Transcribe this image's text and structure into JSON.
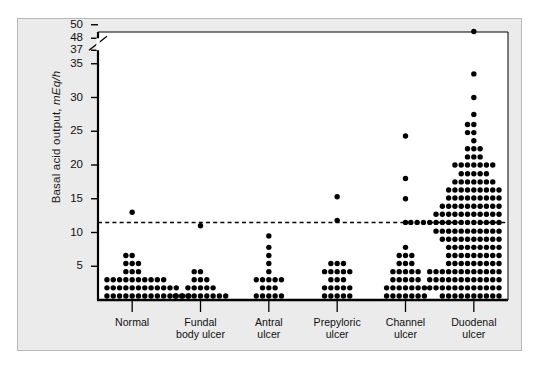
{
  "chart_data": {
    "type": "scatter",
    "plot_style": "dot-plot-strip-chart",
    "title": "",
    "xlabel": "",
    "ylabel": "Basal acid output, mEq/h",
    "ylabel_units_italic": "mEq/h",
    "ylim": [
      0,
      50
    ],
    "grid": false,
    "legend": null,
    "axis_break": {
      "present": true,
      "between": [
        37,
        48
      ],
      "marker": "diagonal-slash"
    },
    "yticks": [
      5,
      10,
      15,
      20,
      25,
      30,
      35,
      37,
      48,
      50
    ],
    "reference_line": {
      "value": 11.5,
      "style": "dashed",
      "orientation": "horizontal"
    },
    "categories": [
      "Normal",
      "Fundal body ulcer",
      "Antral ulcer",
      "Prepyloric ulcer",
      "Channel ulcer",
      "Duodenal ulcer"
    ],
    "category_lines": [
      [
        "Normal"
      ],
      [
        "Fundal",
        "body ulcer"
      ],
      [
        "Antral",
        "ulcer"
      ],
      [
        "Prepyloric",
        "ulcer"
      ],
      [
        "Channel",
        "ulcer"
      ],
      [
        "Duodenal",
        "ulcer"
      ]
    ],
    "series": [
      {
        "name": "Normal",
        "stacks": [
          {
            "value": 0.6,
            "count": 19
          },
          {
            "value": 1.8,
            "count": 15
          },
          {
            "value": 3.0,
            "count": 11
          },
          {
            "value": 4.2,
            "count": 3
          },
          {
            "value": 5.4,
            "count": 3
          },
          {
            "value": 6.6,
            "count": 2
          },
          {
            "value": 13.0,
            "count": 1
          }
        ]
      },
      {
        "name": "Fundal body ulcer",
        "stacks": [
          {
            "value": 0.6,
            "count": 9
          },
          {
            "value": 1.8,
            "count": 5
          },
          {
            "value": 3.0,
            "count": 3
          },
          {
            "value": 4.2,
            "count": 2
          },
          {
            "value": 11.0,
            "count": 1
          }
        ]
      },
      {
        "name": "Antral ulcer",
        "stacks": [
          {
            "value": 0.6,
            "count": 5
          },
          {
            "value": 1.8,
            "count": 3
          },
          {
            "value": 3.0,
            "count": 5
          },
          {
            "value": 4.2,
            "count": 1
          },
          {
            "value": 5.4,
            "count": 1
          },
          {
            "value": 6.6,
            "count": 1
          },
          {
            "value": 7.8,
            "count": 1
          },
          {
            "value": 9.5,
            "count": 1
          }
        ]
      },
      {
        "name": "Prepyloric ulcer",
        "stacks": [
          {
            "value": 0.6,
            "count": 5
          },
          {
            "value": 1.8,
            "count": 5
          },
          {
            "value": 3.0,
            "count": 3
          },
          {
            "value": 4.2,
            "count": 5
          },
          {
            "value": 5.4,
            "count": 3
          },
          {
            "value": 11.8,
            "count": 1
          },
          {
            "value": 15.3,
            "count": 1
          }
        ]
      },
      {
        "name": "Channel ulcer",
        "stacks": [
          {
            "value": 0.6,
            "count": 7
          },
          {
            "value": 1.8,
            "count": 7
          },
          {
            "value": 3.0,
            "count": 5
          },
          {
            "value": 4.2,
            "count": 5
          },
          {
            "value": 5.4,
            "count": 3
          },
          {
            "value": 6.6,
            "count": 3
          },
          {
            "value": 7.8,
            "count": 1
          },
          {
            "value": 11.5,
            "count": 1
          },
          {
            "value": 15.0,
            "count": 1
          },
          {
            "value": 18.0,
            "count": 1
          },
          {
            "value": 24.3,
            "count": 1
          }
        ]
      },
      {
        "name": "Duodenal ulcer",
        "stacks": [
          {
            "value": 0.6,
            "count": 11
          },
          {
            "value": 1.8,
            "count": 15
          },
          {
            "value": 3.0,
            "count": 15
          },
          {
            "value": 4.2,
            "count": 15
          },
          {
            "value": 5.4,
            "count": 9
          },
          {
            "value": 6.6,
            "count": 9
          },
          {
            "value": 7.8,
            "count": 9
          },
          {
            "value": 9.0,
            "count": 11
          },
          {
            "value": 10.2,
            "count": 13
          },
          {
            "value": 11.5,
            "count": 21
          },
          {
            "value": 12.7,
            "count": 13
          },
          {
            "value": 13.9,
            "count": 11
          },
          {
            "value": 15.1,
            "count": 9
          },
          {
            "value": 16.3,
            "count": 9
          },
          {
            "value": 17.5,
            "count": 7
          },
          {
            "value": 18.7,
            "count": 5
          },
          {
            "value": 20.0,
            "count": 7
          },
          {
            "value": 21.2,
            "count": 3
          },
          {
            "value": 22.4,
            "count": 3
          },
          {
            "value": 23.6,
            "count": 1
          },
          {
            "value": 24.8,
            "count": 2
          },
          {
            "value": 26.0,
            "count": 2
          },
          {
            "value": 27.5,
            "count": 1
          },
          {
            "value": 30.0,
            "count": 1
          },
          {
            "value": 33.5,
            "count": 1
          },
          {
            "value": 49.0,
            "count": 1
          }
        ]
      }
    ]
  },
  "style": {
    "dot_color": "#000000",
    "axis_color": "#000000",
    "panel_background": "#ebebeb",
    "plot_background": "#ffffff",
    "page_background": "#ffffff"
  }
}
